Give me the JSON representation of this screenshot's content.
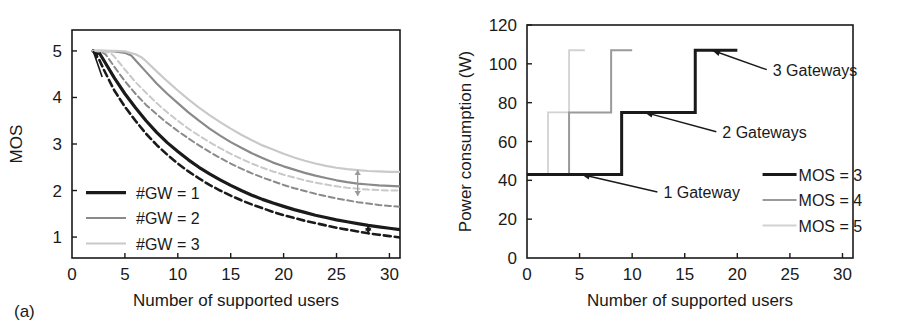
{
  "figure": {
    "panel_a_caption": "(a)",
    "panel_b_caption": "(b)"
  },
  "chart_data": [
    {
      "id": "panel-a",
      "type": "line",
      "title": "",
      "xlabel": "Number of supported users",
      "ylabel": "MOS",
      "xlim": [
        0,
        31
      ],
      "ylim": [
        0.55,
        5.45
      ],
      "xticks": [
        0,
        5,
        10,
        15,
        20,
        25,
        30
      ],
      "yticks": [
        1,
        2,
        3,
        4,
        5
      ],
      "xtick_labels": [
        "0",
        "5",
        "10",
        "15",
        "20",
        "25",
        "30"
      ],
      "ytick_labels": [
        "1",
        "2",
        "3",
        "4",
        "5"
      ],
      "grid": false,
      "legend_position": "lower-left-inside",
      "legend": [
        {
          "label": "#GW = 1",
          "color": "#1a1a1a",
          "style": "solid",
          "width": 3.2
        },
        {
          "label": "#GW = 2",
          "color": "#8a8a8a",
          "style": "solid",
          "width": 2.0
        },
        {
          "label": "#GW = 3",
          "color": "#c9c9c9",
          "style": "solid",
          "width": 2.0
        }
      ],
      "series": [
        {
          "name": "#GW = 1 (solid)",
          "color": "#1a1a1a",
          "style": "solid",
          "width": 3.2,
          "x": [
            2,
            2.6,
            3,
            4,
            5,
            6,
            7,
            8,
            9,
            10,
            11,
            12,
            13,
            14,
            15,
            16,
            17,
            18,
            19,
            20,
            21,
            22,
            23,
            24,
            25,
            26,
            27,
            28,
            29,
            30,
            31
          ],
          "y": [
            5.0,
            4.95,
            4.8,
            4.42,
            4.08,
            3.78,
            3.5,
            3.25,
            3.03,
            2.84,
            2.66,
            2.5,
            2.36,
            2.23,
            2.11,
            2.0,
            1.9,
            1.81,
            1.73,
            1.66,
            1.59,
            1.53,
            1.47,
            1.42,
            1.37,
            1.33,
            1.29,
            1.25,
            1.22,
            1.19,
            1.16
          ]
        },
        {
          "name": "#GW = 1 (dashed)",
          "color": "#1a1a1a",
          "style": "dashed",
          "width": 2.6,
          "x": [
            2,
            2.6,
            3,
            4,
            5,
            6,
            7,
            8,
            9,
            10,
            11,
            12,
            13,
            14,
            15,
            16,
            17,
            18,
            19,
            20,
            21,
            22,
            23,
            24,
            25,
            26,
            27,
            28,
            29,
            30,
            31
          ],
          "y": [
            5.0,
            4.8,
            4.6,
            4.15,
            3.8,
            3.5,
            3.22,
            2.98,
            2.77,
            2.58,
            2.41,
            2.26,
            2.12,
            2.0,
            1.89,
            1.79,
            1.7,
            1.62,
            1.54,
            1.47,
            1.41,
            1.35,
            1.3,
            1.25,
            1.2,
            1.16,
            1.12,
            1.08,
            1.05,
            1.02,
            0.99
          ]
        },
        {
          "name": "#GW = 2 (solid)",
          "color": "#8a8a8a",
          "style": "solid",
          "width": 2.2,
          "x": [
            2,
            3,
            4,
            5,
            5.6,
            6,
            7,
            8,
            9,
            10,
            11,
            12,
            13,
            14,
            15,
            16,
            17,
            18,
            19,
            20,
            21,
            22,
            23,
            24,
            25,
            26,
            27,
            28,
            29,
            30,
            31
          ],
          "y": [
            5.0,
            5.0,
            4.99,
            4.96,
            4.9,
            4.8,
            4.55,
            4.3,
            4.08,
            3.88,
            3.68,
            3.5,
            3.33,
            3.18,
            3.04,
            2.92,
            2.8,
            2.7,
            2.6,
            2.52,
            2.45,
            2.38,
            2.32,
            2.27,
            2.22,
            2.18,
            2.15,
            2.13,
            2.11,
            2.1,
            2.09
          ]
        },
        {
          "name": "#GW = 2 (dashed)",
          "color": "#8a8a8a",
          "style": "dashed",
          "width": 2.0,
          "x": [
            2,
            2.8,
            3.2,
            4,
            5,
            6,
            7,
            8,
            9,
            10,
            11,
            12,
            13,
            14,
            15,
            16,
            17,
            18,
            19,
            20,
            21,
            22,
            23,
            24,
            25,
            26,
            27,
            28,
            29,
            30,
            31
          ],
          "y": [
            5.0,
            4.98,
            4.92,
            4.66,
            4.35,
            4.08,
            3.84,
            3.64,
            3.45,
            3.28,
            3.12,
            2.97,
            2.83,
            2.7,
            2.58,
            2.47,
            2.37,
            2.28,
            2.2,
            2.12,
            2.05,
            1.99,
            1.93,
            1.88,
            1.83,
            1.79,
            1.75,
            1.72,
            1.69,
            1.67,
            1.65
          ]
        },
        {
          "name": "#GW = 3 (solid)",
          "color": "#c9c9c9",
          "style": "solid",
          "width": 2.2,
          "x": [
            2,
            3,
            4,
            5,
            6,
            6.6,
            7,
            8,
            9,
            10,
            11,
            12,
            13,
            14,
            15,
            16,
            17,
            18,
            19,
            20,
            21,
            22,
            23,
            24,
            25,
            26,
            27,
            28,
            29,
            30,
            31
          ],
          "y": [
            5.0,
            5.0,
            5.0,
            4.99,
            4.93,
            4.86,
            4.78,
            4.56,
            4.35,
            4.15,
            3.96,
            3.78,
            3.62,
            3.47,
            3.33,
            3.2,
            3.08,
            2.97,
            2.88,
            2.79,
            2.71,
            2.64,
            2.58,
            2.53,
            2.49,
            2.46,
            2.44,
            2.42,
            2.41,
            2.4,
            2.4
          ]
        },
        {
          "name": "#GW = 3 (dashed)",
          "color": "#c9c9c9",
          "style": "dashed",
          "width": 2.0,
          "x": [
            2,
            3,
            3.6,
            4,
            5,
            6,
            7,
            8,
            9,
            10,
            11,
            12,
            13,
            14,
            15,
            16,
            17,
            18,
            19,
            20,
            21,
            22,
            23,
            24,
            25,
            26,
            27,
            28,
            29,
            30,
            31
          ],
          "y": [
            5.0,
            4.99,
            4.96,
            4.88,
            4.6,
            4.33,
            4.1,
            3.88,
            3.68,
            3.5,
            3.33,
            3.18,
            3.04,
            2.91,
            2.79,
            2.68,
            2.58,
            2.49,
            2.41,
            2.34,
            2.28,
            2.22,
            2.17,
            2.13,
            2.09,
            2.06,
            2.04,
            2.02,
            2.01,
            2.0,
            2.0
          ]
        }
      ],
      "annotations": [
        {
          "name": "gap-arrow-upper",
          "x": 27.0,
          "y_from": 2.44,
          "y_to": 1.88,
          "color": "#9a9a9a"
        },
        {
          "name": "gap-arrow-lower",
          "x": 28.0,
          "y_from": 1.25,
          "y_to": 1.08,
          "color": "#1a1a1a"
        },
        {
          "name": "origin-arrow",
          "x": 2.0,
          "y": 5.0,
          "color": "#1a1a1a"
        }
      ]
    },
    {
      "id": "panel-b",
      "type": "line",
      "subtype": "step",
      "title": "",
      "xlabel": "Number of supported users",
      "ylabel": "Power consumption (W)",
      "xlim": [
        0,
        31
      ],
      "ylim": [
        0,
        120
      ],
      "xticks": [
        0,
        5,
        10,
        15,
        20,
        25,
        30
      ],
      "yticks": [
        0,
        20,
        40,
        60,
        80,
        100,
        120
      ],
      "xtick_labels": [
        "0",
        "5",
        "10",
        "15",
        "20",
        "25",
        "30"
      ],
      "ytick_labels": [
        "0",
        "20",
        "40",
        "60",
        "80",
        "100",
        "120"
      ],
      "grid": false,
      "legend_position": "lower-right-inside",
      "legend": [
        {
          "label": "MOS = 3",
          "color": "#1a1a1a",
          "style": "solid",
          "width": 3.2
        },
        {
          "label": "MOS = 4",
          "color": "#9a9a9a",
          "style": "solid",
          "width": 2.0
        },
        {
          "label": "MOS = 5",
          "color": "#d2d2d2",
          "style": "solid",
          "width": 1.8
        }
      ],
      "series": [
        {
          "name": "MOS = 3",
          "color": "#1a1a1a",
          "style": "solid",
          "width": 3.0,
          "steps_x": [
            0,
            9,
            9,
            16,
            16,
            20
          ],
          "steps_y": [
            43,
            43,
            75,
            75,
            107,
            107
          ]
        },
        {
          "name": "MOS = 4",
          "color": "#9a9a9a",
          "style": "solid",
          "width": 2.0,
          "steps_x": [
            0,
            4,
            4,
            8,
            8,
            10
          ],
          "steps_y": [
            43,
            43,
            75,
            75,
            107,
            107
          ]
        },
        {
          "name": "MOS = 5",
          "color": "#d2d2d2",
          "style": "solid",
          "width": 1.8,
          "steps_x": [
            0,
            2,
            2,
            4,
            4,
            5.5
          ],
          "steps_y": [
            43,
            43,
            75,
            75,
            107,
            107
          ]
        }
      ],
      "annotations": [
        {
          "name": "annotation-1-gateway",
          "label": "1 Gateway",
          "tip_x": 5.2,
          "tip_y": 43,
          "text_x": 12.4,
          "text_y": 34
        },
        {
          "name": "annotation-2-gateways",
          "label": "2 Gateways",
          "tip_x": 11.2,
          "tip_y": 75,
          "text_x": 18.0,
          "text_y": 65
        },
        {
          "name": "annotation-3-gateways",
          "label": "3 Gateways",
          "tip_x": 17.6,
          "tip_y": 107,
          "text_x": 22.8,
          "text_y": 97
        }
      ]
    }
  ]
}
